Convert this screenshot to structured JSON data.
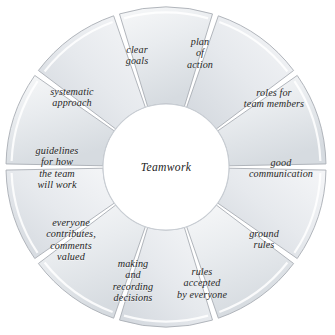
{
  "diagram": {
    "type": "segmented-wheel",
    "title": "Teamwork",
    "hub_label": "Teamwork",
    "segment_count": 10,
    "colors": {
      "segment_fill_light": "#f4f5f6",
      "segment_fill_mid": "#e4e7ea",
      "segment_fill_dark": "#d4d9de",
      "segment_stroke": "#a9aeb4",
      "divider": "#ffffff",
      "hub_fill": "#ffffff",
      "text": "#1d1d1d",
      "background": "#ffffff"
    },
    "geometry": {
      "center_x": 166,
      "center_y": 167,
      "outer_radius": 160,
      "inner_radius": 63,
      "gap_degrees": 2.2
    },
    "segments": [
      {
        "id": "clear-goals",
        "label": "clear\ngoals",
        "label_x": 137,
        "label_y": 55,
        "start_angle": -90,
        "end_angle": -54
      },
      {
        "id": "plan-of-action",
        "label": "plan\nof\naction",
        "label_x": 200,
        "label_y": 53,
        "start_angle": -90,
        "end_angle": -54
      },
      {
        "id": "roles-for-team-members",
        "label": "roles for\nteam members",
        "label_x": 274,
        "label_y": 98,
        "start_angle": -54,
        "end_angle": -18
      },
      {
        "id": "good-communication",
        "label": "good\ncommunication",
        "label_x": 281,
        "label_y": 168,
        "start_angle": -18,
        "end_angle": 18
      },
      {
        "id": "ground-rules",
        "label": "ground\nrules",
        "label_x": 264,
        "label_y": 239,
        "start_angle": 18,
        "end_angle": 54
      },
      {
        "id": "rules-accepted-by-everyone",
        "label": "rules\naccepted\nby everyone",
        "label_x": 202,
        "label_y": 283,
        "start_angle": 54,
        "end_angle": 90
      },
      {
        "id": "making-and-recording-decisions",
        "label": "making\nand\nrecording\ndecisions",
        "label_x": 133,
        "label_y": 281,
        "start_angle": 90,
        "end_angle": 126
      },
      {
        "id": "everyone-contributes-comments-valued",
        "label": "everyone\ncontributes,\ncomments\nvalued",
        "label_x": 71,
        "label_y": 240,
        "start_angle": 126,
        "end_angle": 162
      },
      {
        "id": "guidelines-for-how-the-team-will-work",
        "label": "guidelines\nfor how\nthe team\nwill work",
        "label_x": 57,
        "label_y": 168,
        "start_angle": 162,
        "end_angle": 198
      },
      {
        "id": "systematic-approach",
        "label": "systematic\napproach",
        "label_x": 72,
        "label_y": 97,
        "start_angle": 198,
        "end_angle": 234
      }
    ]
  }
}
